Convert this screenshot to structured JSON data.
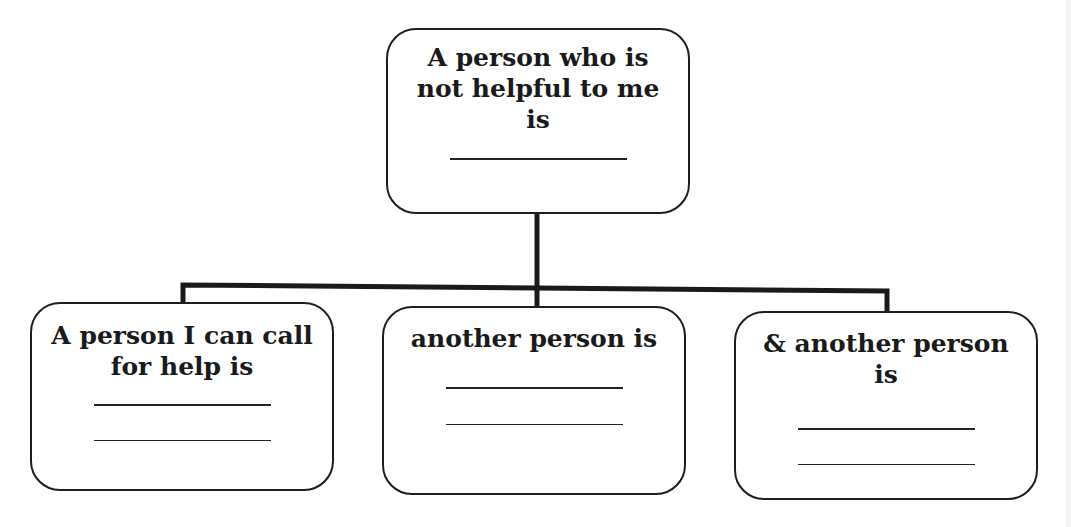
{
  "diagram": {
    "type": "hierarchy",
    "root": {
      "label_lines": [
        "A person who is",
        "not helpful to me",
        "is"
      ],
      "blank_lines": 1
    },
    "children": [
      {
        "label_lines": [
          "A person I can call",
          "for help is"
        ],
        "blank_lines": 2
      },
      {
        "label_lines": [
          "another person is"
        ],
        "blank_lines": 2
      },
      {
        "label_lines": [
          "& another person",
          "is"
        ],
        "blank_lines": 2
      }
    ],
    "colors": {
      "stroke": "#1e1e1e",
      "text": "#1a1a1a",
      "background": "#ffffff"
    }
  }
}
